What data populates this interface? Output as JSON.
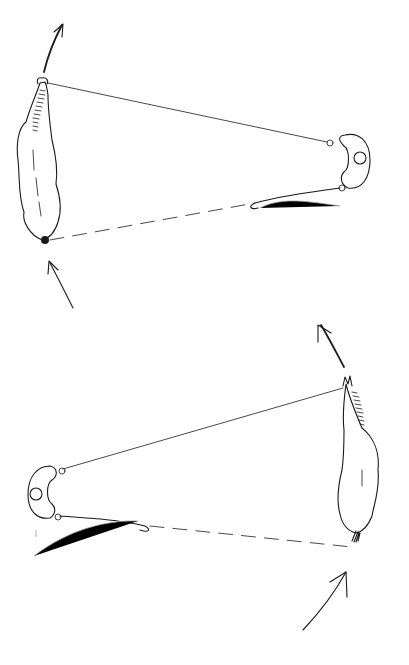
{
  "diagram": {
    "title": "",
    "style": "pen-and-ink sketch, top-down view",
    "colors": {
      "background": "#ffffff",
      "ink": "#1a1a1a",
      "faint": "#9a9a9a"
    },
    "panels": [
      {
        "id": "top",
        "elements": [
          "horse (head up-left, tail down-left)",
          "handler (right)",
          "solid line from handler to horse head",
          "dashed line from horse tail to whip",
          "whip",
          "arrow above head pointing up",
          "arrow below tail pointing up toward tail"
        ]
      },
      {
        "id": "bottom",
        "elements": [
          "horse (head up-right, tail down-right)",
          "handler (left)",
          "solid line from handler to horse head",
          "dashed line from whip to horse tail",
          "whip",
          "arrow above head pointing up-left",
          "arrow below tail pointing up toward tail"
        ]
      }
    ]
  }
}
